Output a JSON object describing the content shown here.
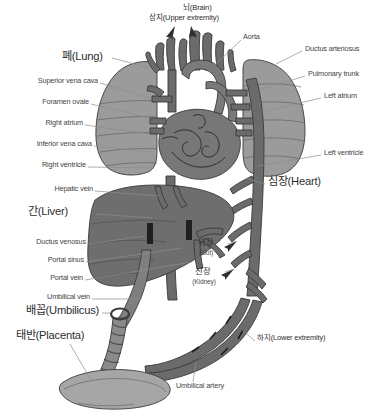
{
  "figure": {
    "caption": "",
    "width": 381,
    "height": 417,
    "background_color": "#ffffff"
  },
  "palette": {
    "lung_fill": "#9b9b9b",
    "liver_fill": "#6e6e6e",
    "heart_fill": "#777777",
    "vessel_fill": "#6b6b6b",
    "vessel_dark": "#5a5a5a",
    "placenta_fill": "#a6a6a6",
    "cord_fill": "#8a8a8a",
    "outline": "#3a3a3a",
    "leader_line": "#8d8d8d",
    "text": "#3b3b3b"
  },
  "labels": {
    "brain": {
      "korean": "뇌(Brain)",
      "english": "Brain",
      "x": 183,
      "y": 9
    },
    "upper_extremity": {
      "korean": "상지(Upper extremity)",
      "english": "Upper extremity",
      "x": 157,
      "y": 18
    },
    "aorta": {
      "text": "Aorta",
      "x": 243,
      "y": 36
    },
    "ductus_arteriosus": {
      "text": "Ductus arteriosus",
      "x": 305,
      "y": 48
    },
    "pulmonary_trunk": {
      "text": "Pulmonary trunk",
      "x": 308,
      "y": 73
    },
    "left_atrium": {
      "text": "Left atrium",
      "x": 324,
      "y": 95
    },
    "left_ventricle": {
      "text": "Left ventricle",
      "x": 324,
      "y": 152
    },
    "lung": {
      "korean": "폐(Lung)",
      "english": "Lung",
      "x": 62,
      "y": 56
    },
    "superior_vena_cava": {
      "text": "Superior vena cava",
      "x": 22,
      "y": 80
    },
    "foramen_ovale": {
      "text": "Foramen ovale",
      "x": 32,
      "y": 101
    },
    "right_atrium": {
      "text": "Right atrium",
      "x": 36,
      "y": 122
    },
    "inferior_vena_cava": {
      "text": "Inferior vena cava",
      "x": 22,
      "y": 143
    },
    "right_ventricle": {
      "text": "Right ventricle",
      "x": 30,
      "y": 164
    },
    "hepatic_vein": {
      "text": "Hepatic vein",
      "x": 36,
      "y": 188
    },
    "liver": {
      "korean": "간(Liver)",
      "english": "Liver",
      "x": 28,
      "y": 211
    },
    "ductus_venosus": {
      "text": "Ductus venosus",
      "x": 14,
      "y": 241
    },
    "portal_sinus": {
      "text": "Portal sinus",
      "x": 36,
      "y": 259
    },
    "portal_vein": {
      "text": "Portal vein",
      "x": 38,
      "y": 277
    },
    "umbilical_vein": {
      "text": "Umbilical vein",
      "x": 30,
      "y": 296
    },
    "umbilicus": {
      "korean": "배꼽(Umbilicus)",
      "english": "Umbilicus",
      "x": 26,
      "y": 309
    },
    "placenta": {
      "korean": "태반(Placenta)",
      "english": "Placenta",
      "x": 16,
      "y": 334
    },
    "heart": {
      "korean": "심장(Heart)",
      "english": "Heart",
      "x": 268,
      "y": 181
    },
    "gut": {
      "korean": "위장",
      "korean_sub": "(Gut)",
      "english": "Gut",
      "x": 200,
      "y": 243
    },
    "kidney": {
      "korean": "신장",
      "korean_sub": "(Kidney)",
      "english": "Kidney",
      "x": 197,
      "y": 273
    },
    "lower_extremity": {
      "korean": "하지(Lower extremity)",
      "english": "Lower extremity",
      "x": 257,
      "y": 339
    },
    "umbilical_artery": {
      "text": "Umbilical artery",
      "x": 176,
      "y": 385
    }
  }
}
